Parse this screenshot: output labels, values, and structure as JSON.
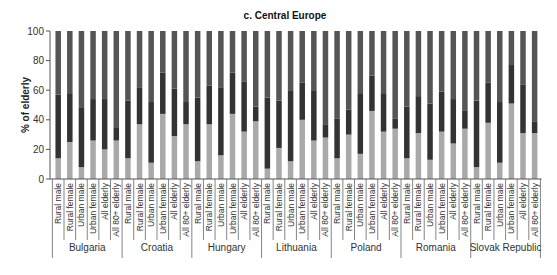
{
  "chart_data": {
    "type": "bar",
    "stacked": true,
    "title": "c. Central Europe",
    "xlabel": "",
    "ylabel": "% of elderly",
    "ylim": [
      0,
      100
    ],
    "yticks": [
      0,
      20,
      40,
      60,
      80,
      100
    ],
    "grid": false,
    "legend": null,
    "groups": [
      "Bulgaria",
      "Croatia",
      "Hungary",
      "Lithuania",
      "Poland",
      "Romania",
      "Slovak Republic"
    ],
    "categories_per_group": [
      "Rural male",
      "Rural female",
      "Urban male",
      "Urban female",
      "All elderly",
      "All 80+ elderly"
    ],
    "segment_colors": [
      "#a9a9a9",
      "#333333",
      "#555555"
    ],
    "series": [
      {
        "name": "bottom (light gray)",
        "values": [
          14,
          25,
          8,
          26,
          20,
          26,
          14,
          37,
          11,
          44,
          29,
          37,
          12,
          37,
          16,
          44,
          32,
          39,
          7,
          21,
          12,
          40,
          26,
          28,
          14,
          30,
          17,
          46,
          32,
          34,
          14,
          31,
          13,
          32,
          24,
          34,
          8,
          38,
          11,
          51,
          31,
          31
        ]
      },
      {
        "name": "middle (dark)",
        "values": [
          43,
          33,
          40,
          28,
          34,
          9,
          39,
          25,
          41,
          28,
          32,
          15,
          43,
          26,
          46,
          28,
          34,
          10,
          48,
          32,
          48,
          25,
          34,
          9,
          27,
          17,
          41,
          24,
          26,
          7,
          35,
          25,
          38,
          27,
          30,
          12,
          45,
          27,
          41,
          26,
          33,
          8
        ]
      },
      {
        "name": "top (medium dark)",
        "values": [
          43,
          42,
          52,
          46,
          46,
          65,
          47,
          38,
          48,
          28,
          39,
          48,
          45,
          37,
          38,
          28,
          34,
          51,
          45,
          47,
          40,
          35,
          40,
          63,
          59,
          53,
          42,
          30,
          42,
          59,
          51,
          44,
          49,
          41,
          46,
          54,
          47,
          35,
          48,
          23,
          36,
          61
        ]
      }
    ]
  }
}
